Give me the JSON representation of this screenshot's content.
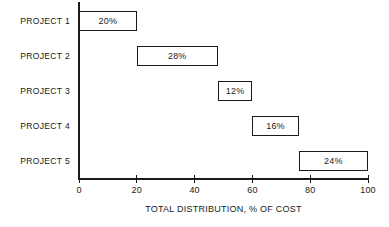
{
  "chart_data": {
    "type": "bar",
    "subtype": "waterfall-cascade-horizontal",
    "orientation": "horizontal",
    "title": "",
    "xlabel": "TOTAL DISTRIBUTION, % OF COST",
    "ylabel": "",
    "categories": [
      "PROJECT 1",
      "PROJECT 2",
      "PROJECT 3",
      "PROJECT 4",
      "PROJECT 5"
    ],
    "values": [
      20,
      28,
      12,
      16,
      24
    ],
    "data_labels": [
      "20%",
      "28%",
      "12%",
      "16%",
      "24%"
    ],
    "bar_starts": [
      0,
      20,
      48,
      60,
      76
    ],
    "bar_ends": [
      20,
      48,
      60,
      76,
      100
    ],
    "xlim": [
      0,
      100
    ],
    "xticks": [
      0,
      20,
      40,
      60,
      80,
      100
    ],
    "xtick_labels": [
      "0",
      "20",
      "40",
      "60",
      "80",
      "100"
    ],
    "grid": false,
    "legend": false,
    "colors": {
      "bar_fill": "#ffffff",
      "bar_stroke": "#1a1a1a",
      "axis": "#1a1a1a",
      "text": "#1a1a1a",
      "background": "#ffffff"
    }
  }
}
